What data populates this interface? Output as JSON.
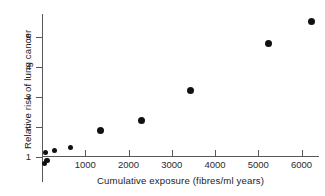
{
  "chart_data": {
    "type": "scatter",
    "title": "",
    "xlabel": "Cumulative exposure (fibres/ml years)",
    "ylabel": "Relative risk of lung cancer",
    "xlim": [
      0,
      6400
    ],
    "ylim": [
      0.7,
      5.8
    ],
    "grid": false,
    "legend": null,
    "xticks": [
      1000,
      2000,
      3000,
      4000,
      5000,
      6000
    ],
    "xtick_labels": [
      "1000",
      "2000",
      "3000",
      "4000",
      "5000",
      "6000"
    ],
    "yticks": [
      1,
      2,
      3,
      4,
      5
    ],
    "ytick_labels": [
      "1",
      "2",
      "3",
      "4",
      "5"
    ],
    "points": [
      {
        "x": 60,
        "y": 0.78
      },
      {
        "x": 120,
        "y": 0.88
      },
      {
        "x": 80,
        "y": 1.15
      },
      {
        "x": 290,
        "y": 1.22
      },
      {
        "x": 660,
        "y": 1.32
      },
      {
        "x": 1355,
        "y": 1.88
      },
      {
        "x": 2300,
        "y": 2.23
      },
      {
        "x": 3440,
        "y": 3.22
      },
      {
        "x": 5230,
        "y": 4.78
      },
      {
        "x": 6230,
        "y": 5.52
      }
    ],
    "point_color": "#111111",
    "axis_color": "#55595b"
  }
}
